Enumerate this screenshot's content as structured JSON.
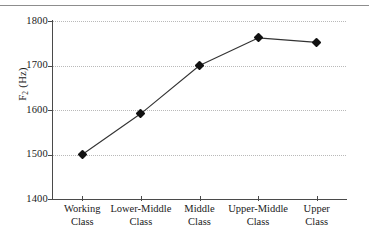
{
  "figure": {
    "background_color": "#ffffff",
    "line_color": "#333333",
    "marker_color": "#111111",
    "grid_color": "#b9b9b9",
    "axis_color": "#4a4a4a",
    "top_rule_color": "#8d8d8d"
  },
  "chart_data": {
    "type": "line",
    "title": "",
    "xlabel": "",
    "ylabel": "F2 (Hz)",
    "ylabel_base": "F",
    "ylabel_sub": "2",
    "ylabel_unit": " (Hz)",
    "categories": [
      "Working Class",
      "Lower-Middle Class",
      "Middle Class",
      "Upper-Middle Class",
      "Upper Class"
    ],
    "category_lines": [
      [
        "Working",
        "Class"
      ],
      [
        "Lower-Middle",
        "Class"
      ],
      [
        "Middle",
        "Class"
      ],
      [
        "Upper-Middle",
        "Class"
      ],
      [
        "Upper",
        "Class"
      ]
    ],
    "values": [
      1500,
      1592,
      1700,
      1762,
      1752
    ],
    "ylim": [
      1400,
      1800
    ],
    "yticks": [
      1400,
      1500,
      1600,
      1700,
      1800
    ],
    "ytick_labels": [
      "1400",
      "1500",
      "1600",
      "1700",
      "1800"
    ],
    "grid": true,
    "grid_style": "dotted-horizontal",
    "legend": "none",
    "marker": "diamond",
    "series": [
      {
        "name": "F2",
        "values": [
          1500,
          1592,
          1700,
          1762,
          1752
        ]
      }
    ]
  }
}
